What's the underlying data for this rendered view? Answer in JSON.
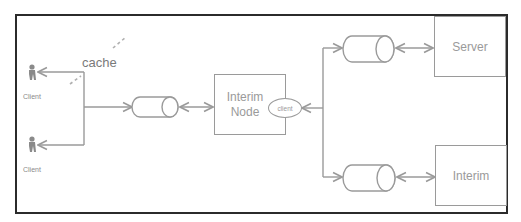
{
  "diagram": {
    "labels": {
      "cache": "cache",
      "client_top": "Client",
      "client_bottom": "Client",
      "interim_node_line1": "Interim",
      "interim_node_line2": "Node",
      "interim_node_client": "client",
      "server": "Server",
      "interim": "Interim"
    },
    "colors": {
      "border": "#2b2b2b",
      "stroke": "#9a9a9a",
      "text": "#8a8a8a",
      "cache_dash": "#b0b0b0"
    },
    "nodes": [
      {
        "id": "client_top",
        "type": "actor",
        "label": "Client"
      },
      {
        "id": "client_bottom",
        "type": "actor",
        "label": "Client"
      },
      {
        "id": "queue_1",
        "type": "cylinder"
      },
      {
        "id": "interim_node",
        "type": "box",
        "label": "Interim Node",
        "sub_label": "client"
      },
      {
        "id": "queue_2",
        "type": "cylinder"
      },
      {
        "id": "queue_3",
        "type": "cylinder"
      },
      {
        "id": "server",
        "type": "box",
        "label": "Server"
      },
      {
        "id": "interim",
        "type": "box",
        "label": "Interim"
      }
    ],
    "edges": [
      {
        "from": "junction_left",
        "to": "client_top",
        "arrow": "end"
      },
      {
        "from": "junction_left",
        "to": "client_bottom",
        "arrow": "end"
      },
      {
        "from": "junction_left",
        "to": "queue_1",
        "arrow": "end"
      },
      {
        "from": "queue_1",
        "to": "interim_node",
        "arrow": "both"
      },
      {
        "from": "junction_right",
        "to": "interim_node",
        "arrow": "end"
      },
      {
        "from": "junction_right",
        "to": "queue_2",
        "arrow": "end"
      },
      {
        "from": "junction_right",
        "to": "queue_3",
        "arrow": "end"
      },
      {
        "from": "queue_2",
        "to": "server",
        "arrow": "both"
      },
      {
        "from": "queue_3",
        "to": "interim",
        "arrow": "both"
      }
    ]
  }
}
